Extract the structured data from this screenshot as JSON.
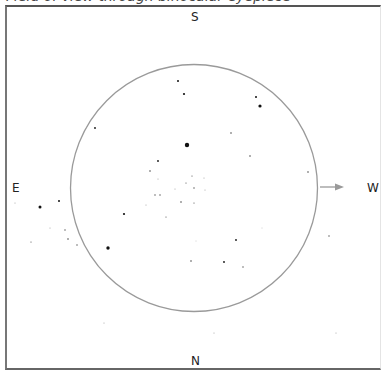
{
  "title": "Field of view through binocular eyepiece",
  "directions": {
    "south": "S",
    "north": "N",
    "east": "E",
    "west": "W"
  },
  "colors": {
    "circle": "#9a9a9a",
    "arrow": "#9a9a9a",
    "star": "#111111",
    "frame": "#555555"
  },
  "field_of_view": {
    "cx": 194,
    "cy": 188,
    "r": 123.5
  },
  "arrow": {
    "x1": 320,
    "y1": 187,
    "x2": 344,
    "y2": 187,
    "label": "W"
  },
  "stars": [
    {
      "x": 178,
      "y": 81,
      "r": 1.0
    },
    {
      "x": 184,
      "y": 94,
      "r": 1.1
    },
    {
      "x": 256,
      "y": 97,
      "r": 1.0
    },
    {
      "x": 260,
      "y": 106,
      "r": 1.6
    },
    {
      "x": 231,
      "y": 133,
      "r": 0.8
    },
    {
      "x": 187,
      "y": 145,
      "r": 2.2
    },
    {
      "x": 250,
      "y": 156,
      "r": 0.8
    },
    {
      "x": 95,
      "y": 128,
      "r": 0.9
    },
    {
      "x": 158,
      "y": 161,
      "r": 0.9
    },
    {
      "x": 150,
      "y": 171,
      "r": 0.8
    },
    {
      "x": 158,
      "y": 179,
      "r": 0.5
    },
    {
      "x": 192,
      "y": 176,
      "r": 0.6
    },
    {
      "x": 186,
      "y": 183,
      "r": 0.6
    },
    {
      "x": 194,
      "y": 188,
      "r": 0.7
    },
    {
      "x": 204,
      "y": 178,
      "r": 0.5
    },
    {
      "x": 205,
      "y": 190,
      "r": 0.5
    },
    {
      "x": 175,
      "y": 189,
      "r": 0.5
    },
    {
      "x": 155,
      "y": 195,
      "r": 0.7
    },
    {
      "x": 160,
      "y": 195,
      "r": 0.7
    },
    {
      "x": 181,
      "y": 202,
      "r": 0.8
    },
    {
      "x": 194,
      "y": 203,
      "r": 0.6
    },
    {
      "x": 146,
      "y": 205,
      "r": 0.5
    },
    {
      "x": 166,
      "y": 217,
      "r": 0.6
    },
    {
      "x": 124,
      "y": 214,
      "r": 1.1
    },
    {
      "x": 308,
      "y": 172,
      "r": 0.8
    },
    {
      "x": 108,
      "y": 248,
      "r": 1.7
    },
    {
      "x": 196,
      "y": 241,
      "r": 0.4
    },
    {
      "x": 236,
      "y": 240,
      "r": 0.9
    },
    {
      "x": 191,
      "y": 261,
      "r": 0.8
    },
    {
      "x": 224,
      "y": 262,
      "r": 0.9
    },
    {
      "x": 243,
      "y": 267,
      "r": 0.7
    },
    {
      "x": 262,
      "y": 228,
      "r": 0.4
    },
    {
      "x": 329,
      "y": 236,
      "r": 0.7
    },
    {
      "x": 15,
      "y": 203,
      "r": 0.5
    },
    {
      "x": 40,
      "y": 207,
      "r": 1.5
    },
    {
      "x": 59,
      "y": 201,
      "r": 1.0
    },
    {
      "x": 50,
      "y": 228,
      "r": 0.5
    },
    {
      "x": 65,
      "y": 230,
      "r": 0.7
    },
    {
      "x": 31,
      "y": 242,
      "r": 0.6
    },
    {
      "x": 68,
      "y": 239,
      "r": 0.8
    },
    {
      "x": 77,
      "y": 245,
      "r": 0.7
    },
    {
      "x": 104,
      "y": 323,
      "r": 0.5
    },
    {
      "x": 214,
      "y": 333,
      "r": 0.5
    },
    {
      "x": 336,
      "y": 333,
      "r": 0.5
    }
  ]
}
